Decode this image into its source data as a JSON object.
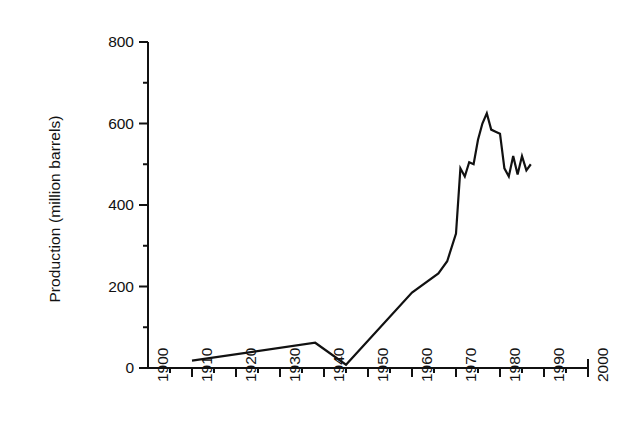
{
  "chart_data": {
    "type": "line",
    "title": "",
    "xlabel": "",
    "ylabel": "Production (million barrels)",
    "xlim": [
      1900,
      2000
    ],
    "ylim": [
      0,
      800
    ],
    "grid": false,
    "legend": null,
    "x_major_ticks": [
      1900,
      1910,
      1920,
      1930,
      1940,
      1950,
      1960,
      1970,
      1980,
      1990,
      2000
    ],
    "x_tick_labels": [
      "1900",
      "1910",
      "1920",
      "1930",
      "1940",
      "1950",
      "1960",
      "1970",
      "1980",
      "1990",
      "2000"
    ],
    "x_minor_tick_interval": 5,
    "y_major_ticks": [
      0,
      200,
      400,
      600,
      800
    ],
    "y_tick_labels": [
      "0",
      "200",
      "400",
      "600",
      "800"
    ],
    "y_minor_tick_interval": 100,
    "line_color": "#111111",
    "line_width": 2.2,
    "series": [
      {
        "name": "Production",
        "x": [
          1910,
          1938,
          1945,
          1960,
          1966,
          1968,
          1970,
          1971,
          1972,
          1973,
          1974,
          1975,
          1976,
          1977,
          1978,
          1979,
          1980,
          1981,
          1982,
          1983,
          1984,
          1985,
          1986,
          1987
        ],
        "values": [
          18,
          62,
          8,
          185,
          232,
          262,
          330,
          490,
          470,
          505,
          500,
          560,
          600,
          625,
          585,
          580,
          575,
          490,
          470,
          520,
          475,
          520,
          485,
          500
        ]
      }
    ]
  },
  "axes": {
    "y_axis_name": "y-axis",
    "x_axis_name": "x-axis"
  }
}
